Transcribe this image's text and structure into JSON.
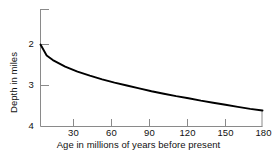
{
  "chart_data": {
    "type": "line",
    "title": "",
    "subtitle": "",
    "xlabel": "Age in millions of years before present",
    "ylabel": "Depth in miles",
    "xlim": [
      0,
      180
    ],
    "ylim": [
      4,
      1.5
    ],
    "y_axis_inverted": true,
    "grid": false,
    "legend": null,
    "xticks": [
      30,
      60,
      90,
      120,
      150,
      180
    ],
    "xtick_labels": [
      "30",
      "60",
      "90",
      "120",
      "150",
      "180"
    ],
    "yticks": [
      2,
      3,
      4
    ],
    "ytick_labels": [
      "2",
      "3",
      "4"
    ],
    "y_untitled_top_tick": 1.125,
    "series": [
      {
        "name": "Ocean floor depth",
        "x": [
          0,
          5,
          10,
          15,
          20,
          30,
          40,
          50,
          60,
          70,
          80,
          90,
          100,
          110,
          120,
          130,
          140,
          150,
          160,
          170,
          180
        ],
        "y": [
          2.0,
          2.27,
          2.38,
          2.46,
          2.54,
          2.66,
          2.76,
          2.85,
          2.93,
          3.0,
          3.07,
          3.14,
          3.2,
          3.26,
          3.31,
          3.37,
          3.42,
          3.47,
          3.52,
          3.57,
          3.61
        ]
      }
    ],
    "annotations": []
  },
  "axes": {
    "y_title": "Depth in miles",
    "x_title": "Age in millions of years before present"
  },
  "colors": {
    "background": "#ffffff",
    "axis": "#8a8a8a",
    "curve": "#000000",
    "text": "#111111"
  }
}
